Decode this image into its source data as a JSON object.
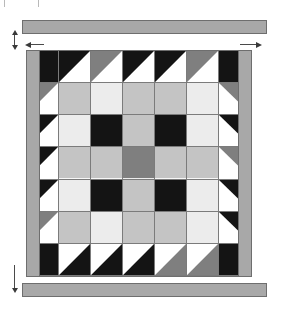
{
  "figure": {
    "kind": "quilt-block-layout-diagram",
    "title": "",
    "grid_rows": 7,
    "grid_cols": 7
  },
  "palette": {
    "black": "#141414",
    "white": "#ffffff",
    "medium_gray": "#7f7f7f",
    "light_gray": "#c4c4c4",
    "pale_gray": "#ececec",
    "sashing_gray": "#a8a8a8",
    "outline": "#6e6e6e",
    "cell_line": "#7b7b7b",
    "arrow": "#3a3a3a"
  },
  "borders": {
    "top_bar": {
      "label": "top border strip",
      "x": 22,
      "y": 20,
      "w": 245,
      "h": 14
    },
    "bottom_bar": {
      "label": "bottom border strip",
      "x": 22,
      "y": 283,
      "w": 245,
      "h": 14
    },
    "left_strip": {
      "label": "left border strip",
      "x": 27,
      "y": 51,
      "w": 13,
      "h": 224
    },
    "right_strip": {
      "label": "right border strip",
      "x": 237,
      "y": 51,
      "w": 13,
      "h": 224
    }
  },
  "quilt": {
    "x": 26,
    "y": 50,
    "w": 226,
    "h": 227
  },
  "dimensions": {
    "vertical_left": {
      "label": "border width",
      "x": 14,
      "y_top": 34,
      "y_bottom": 50
    },
    "vertical_left_lower": {
      "label": "border width",
      "x": 14,
      "y_top": 265,
      "y_bottom": 297
    },
    "horizontal_top_left": {
      "label": "left edge arrow",
      "x": 33,
      "y": 44,
      "dir": "left"
    },
    "horizontal_top_right": {
      "label": "right edge arrow",
      "x": 243,
      "y": 44,
      "dir": "right"
    }
  },
  "cells": [
    [
      "K",
      "HT-tl-K",
      "HT-tl-M",
      "HT-tl-K",
      "HT-tl-K",
      "HT-tl-M",
      "K"
    ],
    [
      "HT-tl-M",
      "L",
      "P",
      "L",
      "L",
      "P",
      "HT-tr-M"
    ],
    [
      "HT-tl-K",
      "P",
      "K",
      "L",
      "K",
      "P",
      "HT-tr-K"
    ],
    [
      "HT-tl-K",
      "L",
      "L",
      "M",
      "L",
      "L",
      "HT-tr-M"
    ],
    [
      "HT-tl-K",
      "P",
      "K",
      "L",
      "K",
      "P",
      "HT-tr-K"
    ],
    [
      "HT-tl-M",
      "L",
      "P",
      "L",
      "L",
      "P",
      "HT-tr-K"
    ],
    [
      "K",
      "HT-br-K",
      "HT-br-K",
      "HT-br-K",
      "HT-br-M",
      "HT-br-M",
      "K"
    ]
  ],
  "legend": {
    "K": "solid black patch",
    "L": "light gray patch",
    "P": "pale gray patch",
    "M": "medium gray patch",
    "HT-tl-K": "half-square triangle, black, upper-left",
    "HT-tl-M": "half-square triangle, medium gray, upper-left",
    "HT-tr-K": "half-square triangle, black, upper-right",
    "HT-tr-M": "half-square triangle, medium gray, upper-right",
    "HT-br-K": "half-square triangle, black, lower-right",
    "HT-br-M": "half-square triangle, medium gray, lower-right"
  },
  "crop_ticks": [
    {
      "x": 4,
      "y": 0,
      "h": 7
    },
    {
      "x": 38,
      "y": 0,
      "h": 7
    }
  ]
}
